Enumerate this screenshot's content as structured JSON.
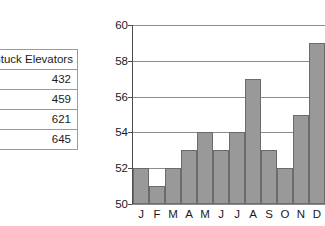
{
  "table": {
    "header": "Stuck Elevators",
    "rows": [
      "432",
      "459",
      "621",
      "645"
    ]
  },
  "chart_data": {
    "type": "bar",
    "title": "",
    "xlabel": "",
    "ylabel": "",
    "categories": [
      "J",
      "F",
      "M",
      "A",
      "M",
      "J",
      "J",
      "A",
      "S",
      "O",
      "N",
      "D"
    ],
    "values": [
      52,
      51,
      52,
      53,
      54,
      53,
      54,
      57,
      53,
      52,
      55,
      59
    ],
    "ylim": [
      50,
      60
    ],
    "yticks": [
      50,
      52,
      54,
      56,
      58,
      60
    ],
    "ytick_labels": [
      "50",
      "52",
      "54",
      "56",
      "58",
      "60"
    ],
    "grid": true,
    "legend": false,
    "bar_color": "#999999",
    "bar_edge_color": "#6b6b6b",
    "gridline_color": "#8c8c8c",
    "axis_color": "#4d4d4d"
  }
}
